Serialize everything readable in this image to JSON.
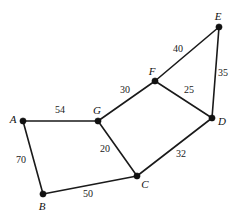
{
  "figure": {
    "kind": "weighted-undirected-graph",
    "background_color": "#ffffff",
    "stroke_color": "#1a1a1a",
    "vertex_color": "#111111"
  },
  "chart_data": {
    "type": "diagram",
    "title": "",
    "xlabel": "",
    "ylabel": "",
    "grid": false,
    "legend": "none",
    "nodes": [
      {
        "id": "A",
        "label": "A",
        "x": 23,
        "y": 121,
        "label_x": 13,
        "label_y": 119
      },
      {
        "id": "B",
        "label": "B",
        "x": 43,
        "y": 194,
        "label_x": 42,
        "label_y": 206
      },
      {
        "id": "C",
        "label": "C",
        "x": 137,
        "y": 176,
        "label_x": 145,
        "label_y": 184
      },
      {
        "id": "D",
        "label": "D",
        "x": 212,
        "y": 118,
        "label_x": 222,
        "label_y": 121
      },
      {
        "id": "E",
        "label": "E",
        "x": 219,
        "y": 27,
        "label_x": 218,
        "label_y": 16
      },
      {
        "id": "F",
        "label": "F",
        "x": 155,
        "y": 81,
        "label_x": 152,
        "label_y": 71
      },
      {
        "id": "G",
        "label": "G",
        "x": 98,
        "y": 121,
        "label_x": 97,
        "label_y": 110
      }
    ],
    "edges": [
      {
        "source": "A",
        "target": "G",
        "weight": 54,
        "label": "54",
        "label_x": 60,
        "label_y": 110
      },
      {
        "source": "A",
        "target": "B",
        "weight": 70,
        "label": "70",
        "label_x": 21,
        "label_y": 160
      },
      {
        "source": "B",
        "target": "C",
        "weight": 50,
        "label": "50",
        "label_x": 88,
        "label_y": 194
      },
      {
        "source": "G",
        "target": "C",
        "weight": 20,
        "label": "20",
        "label_x": 105,
        "label_y": 149
      },
      {
        "source": "G",
        "target": "F",
        "weight": 30,
        "label": "30",
        "label_x": 125,
        "label_y": 90
      },
      {
        "source": "F",
        "target": "E",
        "weight": 40,
        "label": "40",
        "label_x": 178,
        "label_y": 49
      },
      {
        "source": "F",
        "target": "D",
        "weight": 25,
        "label": "25",
        "label_x": 189,
        "label_y": 90
      },
      {
        "source": "E",
        "target": "D",
        "weight": 35,
        "label": "35",
        "label_x": 223,
        "label_y": 73
      },
      {
        "source": "C",
        "target": "D",
        "weight": 32,
        "label": "32",
        "label_x": 181,
        "label_y": 154
      }
    ]
  }
}
